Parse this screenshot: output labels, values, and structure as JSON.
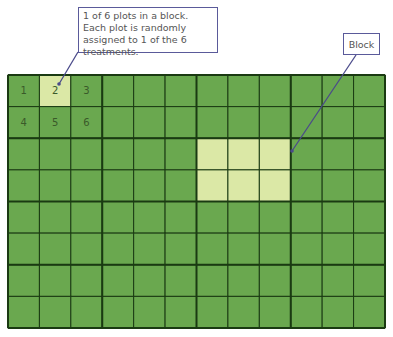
{
  "diagram": {
    "grid": {
      "block_columns": 4,
      "block_rows": 4,
      "plots_per_block_cols": 3,
      "plots_per_block_rows": 2
    },
    "plot_labels": [
      "1",
      "2",
      "3",
      "4",
      "5",
      "6"
    ],
    "highlighted_plot": {
      "block_col": 0,
      "block_row": 0,
      "plot_index": 1
    },
    "highlighted_block": {
      "block_col": 2,
      "block_row": 1
    },
    "callouts": {
      "plot": "1 of 6 plots in a block. Each plot is randomly assigned to 1 of the 6 treatments.",
      "block": "Block"
    },
    "colors": {
      "plot_fill": "#6aa84f",
      "highlight_fill": "#dbe8a6",
      "grid_line": "#1a3a12",
      "callout_border": "#5a5a9a",
      "arrow": "#4a4a8a",
      "label_text": "#3a5a2a"
    }
  }
}
